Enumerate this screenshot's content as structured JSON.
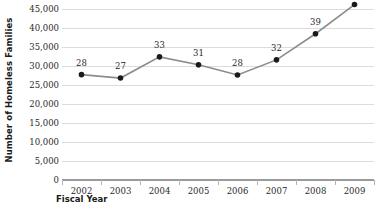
{
  "chart_data": {
    "type": "line",
    "title": "",
    "xlabel": "Fiscal Year",
    "ylabel": "Number of Homeless Families",
    "categories": [
      "2002",
      "2003",
      "2004",
      "2005",
      "2006",
      "2007",
      "2008",
      "2009"
    ],
    "values": [
      27800,
      26900,
      32500,
      30400,
      27700,
      31700,
      38600,
      46300
    ],
    "point_labels": [
      "28",
      "27",
      "33",
      "31",
      "28",
      "32",
      "39",
      "47"
    ],
    "ylim": [
      0,
      47500
    ],
    "ytick_labels": [
      "0",
      "5,000",
      "10,000",
      "15,000",
      "20,000",
      "25,000",
      "30,000",
      "35,000",
      "40,000",
      "45,000"
    ],
    "ytick_values": [
      0,
      5000,
      10000,
      15000,
      20000,
      25000,
      30000,
      35000,
      40000,
      45000
    ],
    "grid": true,
    "legend": "none",
    "series_color": "#8c8c8c",
    "marker_color": "#1a1a1a",
    "gridline_color": "#dcdcdc",
    "baseline_color": "#9a9a9a"
  }
}
